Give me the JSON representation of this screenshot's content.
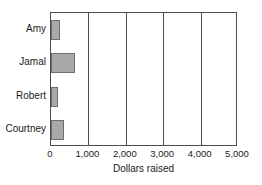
{
  "chart_data": {
    "type": "bar",
    "orientation": "horizontal",
    "title": "",
    "xlabel": "Dollars raised",
    "ylabel": "",
    "categories": [
      "Amy",
      "Jamal",
      "Robert",
      "Courtney"
    ],
    "values": [
      250,
      650,
      180,
      350
    ],
    "xlim": [
      0,
      5000
    ],
    "xticks": [
      0,
      1000,
      2000,
      3000,
      4000,
      5000
    ],
    "xtick_labels": [
      "0",
      "1,000",
      "2,000",
      "3,000",
      "4,000",
      "5,000"
    ],
    "grid": "vertical",
    "legend": null,
    "bar_color": "#a9a9a9",
    "bar_edge_color": "#6e6e6e",
    "axis_color": "#4d4d4d",
    "background": "#ffffff"
  }
}
